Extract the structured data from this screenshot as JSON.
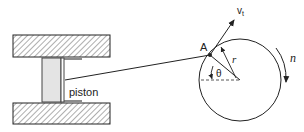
{
  "diagram": {
    "labels": {
      "piston": "piston",
      "point_a": "A",
      "velocity": "v",
      "velocity_subscript": "t",
      "radius": "r",
      "angle": "θ",
      "rotation": "n"
    },
    "colors": {
      "stroke": "#222222",
      "piston_fill": "#e4e4e4",
      "hatch_fill": "#ffffff",
      "dashed": "#444444"
    }
  }
}
